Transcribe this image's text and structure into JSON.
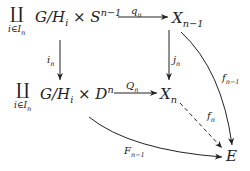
{
  "diagram": {
    "type": "commutative-diagram",
    "nodes": {
      "top_left": {
        "coprod": "∐",
        "index": "i∈I",
        "index_sub": "n",
        "body": "G/H",
        "body_sub": "i",
        "times": " × S",
        "sup": "n−1"
      },
      "top_right": {
        "base": "X",
        "sub": "n−1"
      },
      "mid_left": {
        "coprod": "∐",
        "index": "i∈I",
        "index_sub": "n",
        "body": "G/H",
        "body_sub": "i",
        "times": " × D",
        "sup": "n"
      },
      "mid_right": {
        "base": "X",
        "sub": "n"
      },
      "bottom_right": {
        "base": "E"
      }
    },
    "arrows": {
      "q": {
        "base": "q",
        "sub": "n",
        "from": "top_left",
        "to": "top_right",
        "style": "solid"
      },
      "i": {
        "base": "i",
        "sub": "n",
        "from": "top_left",
        "to": "mid_left",
        "style": "solid"
      },
      "j": {
        "base": "j",
        "sub": "n",
        "from": "top_right",
        "to": "mid_right",
        "style": "solid"
      },
      "Q": {
        "base": "Q",
        "sub": "n",
        "from": "mid_left",
        "to": "mid_right",
        "style": "solid"
      },
      "f_prev": {
        "base": "f",
        "sub": "n−1",
        "from": "top_right",
        "to": "bottom_right",
        "style": "solid-curved"
      },
      "f": {
        "base": "f",
        "sub": "n",
        "from": "mid_right",
        "to": "bottom_right",
        "style": "dashed"
      },
      "F_prev": {
        "base": "F",
        "sub": "n−1",
        "from": "mid_left",
        "to": "bottom_right",
        "style": "solid-curved"
      }
    }
  }
}
